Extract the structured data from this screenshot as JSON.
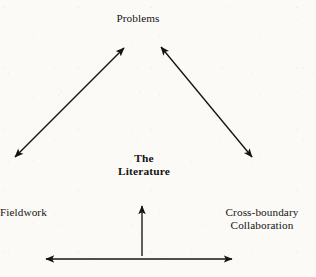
{
  "figure": {
    "background_color": "#fbfaf7",
    "ink_color": "#141414",
    "nodes": {
      "top": {
        "text": "Problems"
      },
      "center": {
        "line1": "The",
        "line2": "Literature"
      },
      "bottom_left": {
        "text": "Fieldwork"
      },
      "bottom_right": {
        "line1": "Cross-boundary",
        "line2": "Collaboration"
      }
    },
    "connectors": [
      {
        "name": "literature-problems-left",
        "style": "double-headed",
        "from": {
          "x": 15,
          "y": 157
        },
        "to": {
          "x": 124,
          "y": 48
        }
      },
      {
        "name": "problems-collaboration-right",
        "style": "double-headed",
        "from": {
          "x": 161,
          "y": 47
        },
        "to": {
          "x": 252,
          "y": 157
        }
      },
      {
        "name": "baseline-to-literature",
        "style": "single-headed-up",
        "from": {
          "x": 142,
          "y": 256
        },
        "to": {
          "x": 142,
          "y": 206
        }
      },
      {
        "name": "fieldwork-collaboration",
        "style": "double-headed",
        "from": {
          "x": 46,
          "y": 259
        },
        "to": {
          "x": 232,
          "y": 259
        }
      }
    ]
  }
}
